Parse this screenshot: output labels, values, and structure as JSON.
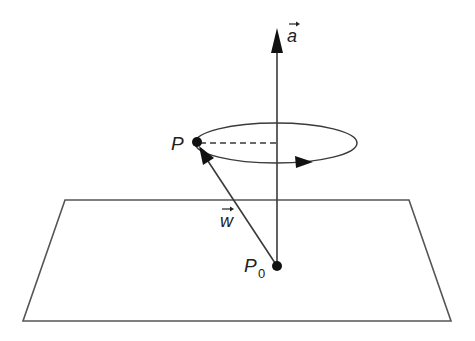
{
  "diagram": {
    "labels": {
      "axis_vector": "a",
      "point": "P",
      "base_point": "P",
      "base_point_subscript": "0",
      "position_vector": "w"
    },
    "colors": {
      "stroke": "#3a3a3a",
      "dot": "#111111",
      "background": "#ffffff"
    },
    "elements": {
      "plane": "parallelogram plane",
      "axis": "vertical axis vector a through P0",
      "orbit": "ellipse of rotation of P around axis a",
      "radius": "dashed line from P to axis",
      "vector_w": "arrow from P0 to P"
    }
  }
}
